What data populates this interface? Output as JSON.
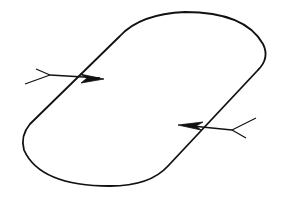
{
  "diagram": {
    "type": "closed-loop-with-crossing-arrows",
    "background": "#ffffff",
    "stroke_color": "#111111",
    "loop": {
      "shape": "stadium (rounded rectangle) in oblique perspective",
      "path": "M 30 124 L 120 36 Q 140 14 185 12 Q 245 12 263 44 Q 270 58 258 70 L 168 166 Q 150 186 110 186 Q 40 186 24 150 Q 20 136 30 124 Z"
    },
    "arrows": [
      {
        "id": "arrow-left",
        "direction": "inward (left to right)",
        "shaft": {
          "x1": 50,
          "y1": 75,
          "x2": 100,
          "y2": 78
        },
        "head": "M 80 74 L 104 79 L 81 83 L 87 78 Z",
        "fletching": [
          "M 50 75 L 36 69",
          "M 50 75 L 25 84"
        ]
      },
      {
        "id": "arrow-right",
        "direction": "inward (right to left)",
        "shaft": {
          "x1": 232,
          "y1": 130,
          "x2": 182,
          "y2": 125
        },
        "head": "M 203 122 L 178 125 L 201 130 L 196 126 Z",
        "fletching": [
          "M 232 130 L 256 118",
          "M 232 130 L 246 138"
        ]
      }
    ]
  }
}
